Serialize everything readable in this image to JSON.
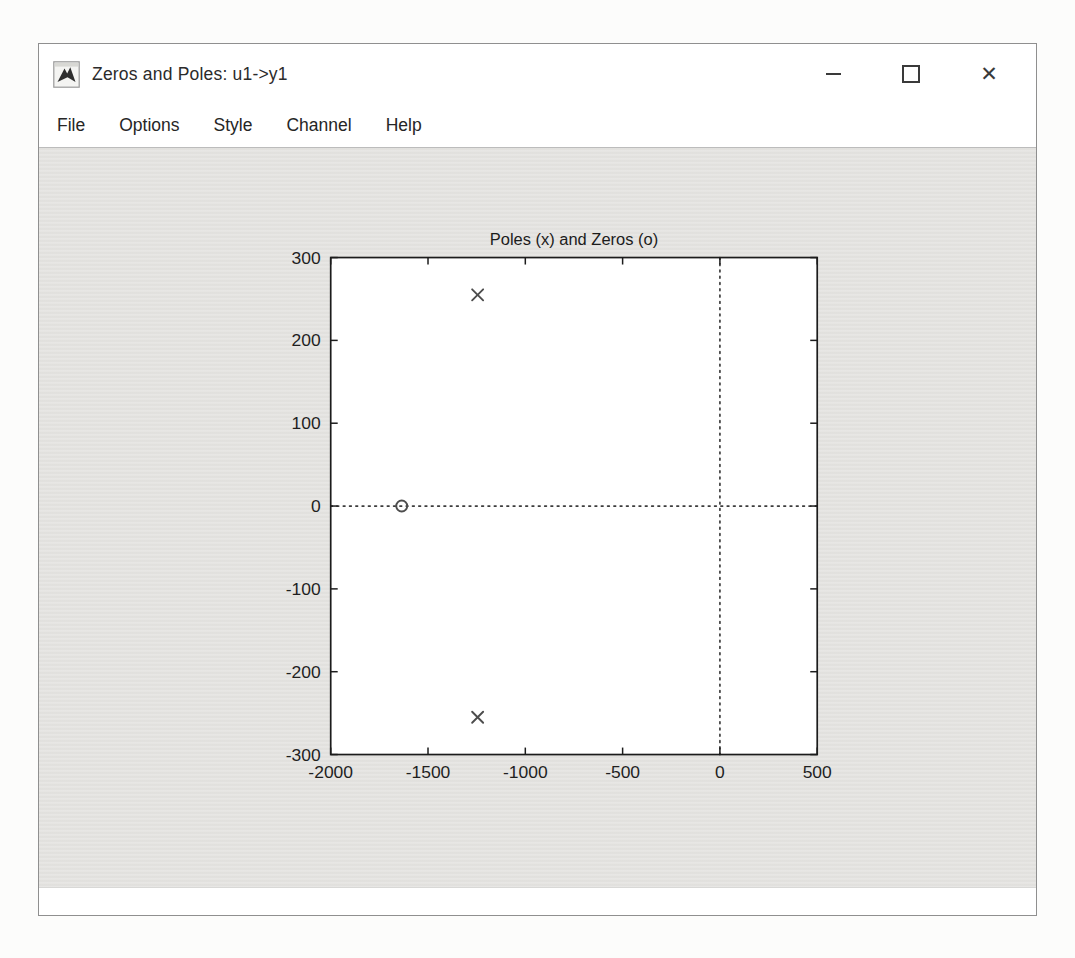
{
  "window": {
    "title": "Zeros and Poles: u1->y1",
    "controls": {
      "minimize_label": "minimize",
      "maximize_label": "maximize",
      "close_label": "close",
      "close_glyph": "✕"
    }
  },
  "menu": {
    "items": [
      {
        "label": "File"
      },
      {
        "label": "Options"
      },
      {
        "label": "Style"
      },
      {
        "label": "Channel"
      },
      {
        "label": "Help"
      }
    ]
  },
  "chart_data": {
    "type": "scatter",
    "title": "Poles (x) and Zeros (o)",
    "xlabel": "",
    "ylabel": "",
    "xlim": [
      -2000,
      500
    ],
    "ylim": [
      -300,
      300
    ],
    "xticks": [
      -2000,
      -1500,
      -1000,
      -500,
      0,
      500
    ],
    "yticks": [
      -300,
      -200,
      -100,
      0,
      100,
      200,
      300
    ],
    "grid": false,
    "zero_axis_lines": "dotted",
    "legend": "none",
    "series": [
      {
        "name": "poles",
        "marker": "x",
        "points": [
          [
            -1245,
            255
          ],
          [
            -1245,
            -255
          ]
        ]
      },
      {
        "name": "zeros",
        "marker": "o",
        "points": [
          [
            -1635,
            0
          ]
        ]
      }
    ]
  },
  "colors": {
    "figure_bg": "#e3e2df",
    "plot_bg": "#ffffff",
    "axis": "#1c1c1c",
    "tick_text": "#1f1f1f",
    "dotted_line": "#3c3c3c",
    "marker": "#4d4d4d",
    "title_text": "#1c1c1c"
  }
}
